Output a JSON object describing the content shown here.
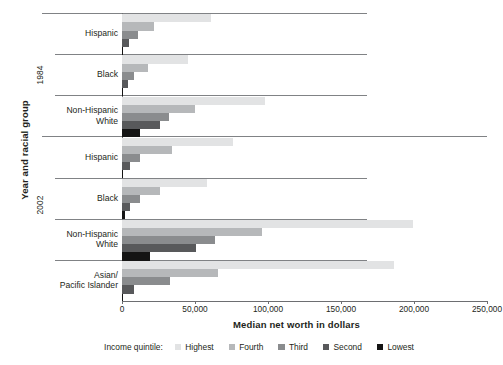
{
  "chart_data": {
    "type": "bar",
    "orientation": "horizontal",
    "title": "",
    "xlabel": "Median net worth in dollars",
    "ylabel": "Year and racial group",
    "xlim": [
      0,
      250000
    ],
    "grid": false,
    "legend_position": "bottom",
    "legend_title": "Income quintile:",
    "xtick_labels": [
      "0",
      "50,000",
      "100,000",
      "150,000",
      "200,000",
      "250,000"
    ],
    "xtick_values": [
      0,
      50000,
      100000,
      150000,
      200000,
      250000
    ],
    "super_categories": [
      "1984",
      "2002"
    ],
    "categories": [
      "Hispanic",
      "Black",
      "Non-Hispanic White",
      "Hispanic",
      "Black",
      "Non-Hispanic White",
      "Asian/ Pacific Islander"
    ],
    "series": [
      {
        "name": "Highest",
        "color": "#e2e3e4",
        "values": [
          61000,
          45000,
          98000,
          76000,
          58000,
          199000,
          186000
        ]
      },
      {
        "name": "Fourth",
        "color": "#b6b8ba",
        "values": [
          22000,
          18000,
          50000,
          34000,
          26000,
          96000,
          66000
        ]
      },
      {
        "name": "Third",
        "color": "#8a8c8e",
        "values": [
          11000,
          8000,
          32000,
          12000,
          12000,
          64000,
          33000
        ]
      },
      {
        "name": "Second",
        "color": "#58595b",
        "values": [
          5000,
          4000,
          26000,
          5500,
          5500,
          51000,
          8000
        ]
      },
      {
        "name": "Lowest",
        "color": "#141414",
        "values": [
          1000,
          1000,
          12000,
          600,
          2000,
          19000,
          500
        ]
      }
    ],
    "groups": [
      {
        "super": "1984",
        "label_lines": [
          "Hispanic"
        ],
        "values": {
          "Highest": 61000,
          "Fourth": 22000,
          "Third": 11000,
          "Second": 5000,
          "Lowest": 1000
        }
      },
      {
        "super": "1984",
        "label_lines": [
          "Black"
        ],
        "values": {
          "Highest": 45000,
          "Fourth": 18000,
          "Third": 8000,
          "Second": 4000,
          "Lowest": 1000
        }
      },
      {
        "super": "1984",
        "label_lines": [
          "Non-Hispanic",
          "White"
        ],
        "values": {
          "Highest": 98000,
          "Fourth": 50000,
          "Third": 32000,
          "Second": 26000,
          "Lowest": 12000
        }
      },
      {
        "super": "2002",
        "label_lines": [
          "Hispanic"
        ],
        "values": {
          "Highest": 76000,
          "Fourth": 34000,
          "Third": 12000,
          "Second": 5500,
          "Lowest": 600
        }
      },
      {
        "super": "2002",
        "label_lines": [
          "Black"
        ],
        "values": {
          "Highest": 58000,
          "Fourth": 26000,
          "Third": 12000,
          "Second": 5500,
          "Lowest": 2000
        }
      },
      {
        "super": "2002",
        "label_lines": [
          "Non-Hispanic",
          "White"
        ],
        "values": {
          "Highest": 199000,
          "Fourth": 96000,
          "Third": 64000,
          "Second": 51000,
          "Lowest": 19000
        }
      },
      {
        "super": "2002",
        "label_lines": [
          "Asian/",
          "Pacific Islander"
        ],
        "values": {
          "Highest": 186000,
          "Fourth": 66000,
          "Third": 33000,
          "Second": 8000,
          "Lowest": 500
        }
      }
    ]
  },
  "axes": {
    "y_title": "Year and racial group",
    "x_title": "Median net worth in dollars",
    "year_1984": "1984",
    "year_2002": "2002"
  },
  "legend": {
    "title": "Income quintile:",
    "items": [
      {
        "label": "Highest",
        "color": "#e2e3e4"
      },
      {
        "label": "Fourth",
        "color": "#b6b8ba"
      },
      {
        "label": "Third",
        "color": "#8a8c8e"
      },
      {
        "label": "Second",
        "color": "#58595b"
      },
      {
        "label": "Lowest",
        "color": "#141414"
      }
    ]
  },
  "ticks": {
    "labels": [
      "0",
      "50,000",
      "100,000",
      "150,000",
      "200,000",
      "250,000"
    ]
  }
}
